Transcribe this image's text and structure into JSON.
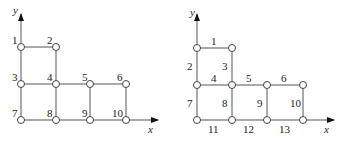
{
  "left_diagram": {
    "title": "node numbering",
    "axis_labels": {
      "x": "x",
      "y": "y"
    },
    "nodes": [
      {
        "label": "1",
        "col": 0,
        "row": 0
      },
      {
        "label": "2",
        "col": 1,
        "row": 0
      },
      {
        "label": "3",
        "col": 0,
        "row": 1
      },
      {
        "label": "4",
        "col": 1,
        "row": 1
      },
      {
        "label": "5",
        "col": 2,
        "row": 1
      },
      {
        "label": "6",
        "col": 3,
        "row": 1
      },
      {
        "label": "7",
        "col": 0,
        "row": 2
      },
      {
        "label": "8",
        "col": 1,
        "row": 2
      },
      {
        "label": "9",
        "col": 2,
        "row": 2
      },
      {
        "label": "10",
        "col": 3,
        "row": 2
      }
    ]
  },
  "right_diagram": {
    "title": "edge numbering",
    "axis_labels": {
      "x": "x",
      "y": "y"
    },
    "edges": [
      {
        "label": "1",
        "from": [
          0,
          0
        ],
        "to": [
          1,
          0
        ]
      },
      {
        "label": "2",
        "from": [
          0,
          0
        ],
        "to": [
          0,
          1
        ]
      },
      {
        "label": "3",
        "from": [
          1,
          0
        ],
        "to": [
          1,
          1
        ]
      },
      {
        "label": "4",
        "from": [
          0,
          1
        ],
        "to": [
          1,
          1
        ]
      },
      {
        "label": "5",
        "from": [
          1,
          1
        ],
        "to": [
          2,
          1
        ]
      },
      {
        "label": "6",
        "from": [
          2,
          1
        ],
        "to": [
          3,
          1
        ]
      },
      {
        "label": "7",
        "from": [
          0,
          1
        ],
        "to": [
          0,
          2
        ]
      },
      {
        "label": "8",
        "from": [
          1,
          1
        ],
        "to": [
          1,
          2
        ]
      },
      {
        "label": "9",
        "from": [
          2,
          1
        ],
        "to": [
          2,
          2
        ]
      },
      {
        "label": "10",
        "from": [
          3,
          1
        ],
        "to": [
          3,
          2
        ]
      },
      {
        "label": "11",
        "from": [
          0,
          2
        ],
        "to": [
          1,
          2
        ]
      },
      {
        "label": "12",
        "from": [
          1,
          2
        ],
        "to": [
          2,
          2
        ]
      },
      {
        "label": "13",
        "from": [
          2,
          2
        ],
        "to": [
          3,
          2
        ]
      }
    ]
  },
  "colors": {
    "line": "#555555",
    "node_fill": "#ffffff",
    "text": "#222222"
  }
}
